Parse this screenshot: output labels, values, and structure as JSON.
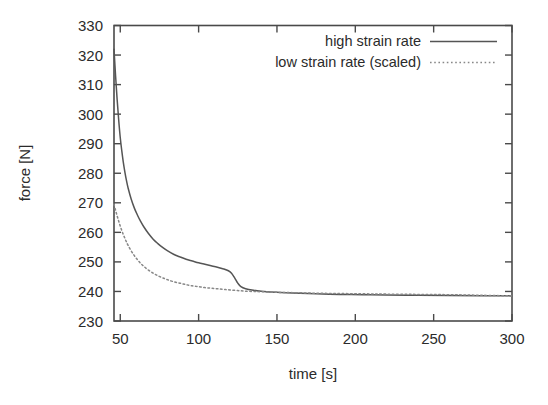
{
  "chart_data": {
    "type": "line",
    "title": "",
    "xlabel": "time [s]",
    "ylabel": "force [N]",
    "xlim": [
      46,
      300
    ],
    "ylim": [
      230,
      330
    ],
    "xticks": [
      50,
      100,
      150,
      200,
      250,
      300
    ],
    "yticks": [
      230,
      240,
      250,
      260,
      270,
      280,
      290,
      300,
      310,
      320,
      330
    ],
    "grid": false,
    "legend_position": "top-right",
    "series": [
      {
        "name": "high strain rate",
        "style": "solid",
        "color": "#555555",
        "x": [
          46,
          47,
          48,
          49,
          50,
          51,
          52,
          53,
          54,
          55,
          57,
          59,
          61,
          63,
          65,
          68,
          71,
          74,
          77,
          80,
          84,
          88,
          92,
          96,
          100,
          104,
          108,
          112,
          116,
          119,
          121,
          123,
          125,
          127,
          130,
          135,
          140,
          150,
          160,
          175,
          190,
          205,
          220,
          240,
          260,
          280,
          300
        ],
        "values": [
          322.0,
          313.0,
          305.0,
          298.0,
          292.0,
          287.5,
          283.5,
          280.2,
          277.4,
          275.0,
          271.2,
          268.2,
          265.8,
          263.7,
          261.9,
          259.6,
          257.7,
          256.2,
          254.9,
          253.8,
          252.6,
          251.7,
          250.9,
          250.3,
          249.7,
          249.2,
          248.7,
          248.2,
          247.6,
          247.0,
          246.2,
          244.6,
          242.8,
          241.6,
          240.9,
          240.4,
          240.1,
          239.7,
          239.5,
          239.2,
          239.0,
          238.9,
          238.8,
          238.7,
          238.6,
          238.55,
          238.5
        ]
      },
      {
        "name": "low strain rate (scaled)",
        "style": "dotted",
        "color": "#888888",
        "x": [
          46,
          47,
          48,
          49,
          50,
          51,
          52,
          53,
          54,
          55,
          57,
          59,
          61,
          63,
          65,
          68,
          71,
          74,
          77,
          80,
          84,
          88,
          92,
          96,
          100,
          104,
          108,
          112,
          116,
          120,
          125,
          130,
          135,
          140,
          150,
          160,
          175,
          190,
          205,
          220,
          240,
          260,
          280,
          300
        ],
        "values": [
          269.5,
          267.5,
          265.6,
          263.8,
          262.1,
          260.6,
          259.2,
          257.9,
          256.7,
          255.6,
          253.7,
          252.1,
          250.7,
          249.5,
          248.5,
          247.2,
          246.2,
          245.3,
          244.6,
          244.0,
          243.3,
          242.8,
          242.3,
          241.9,
          241.6,
          241.3,
          241.1,
          240.9,
          240.7,
          240.5,
          240.3,
          240.1,
          240.0,
          239.9,
          239.7,
          239.6,
          239.4,
          239.3,
          239.2,
          239.1,
          239.0,
          238.9,
          238.7,
          238.5
        ]
      }
    ]
  },
  "legend": {
    "entries": [
      {
        "label": "high strain rate",
        "style": "solid"
      },
      {
        "label": "low strain rate (scaled)",
        "style": "dotted"
      }
    ]
  },
  "axes": {
    "x_label": "time [s]",
    "y_label": "force [N]",
    "x_tick_labels": [
      "50",
      "100",
      "150",
      "200",
      "250",
      "300"
    ],
    "y_tick_labels": [
      "230",
      "240",
      "250",
      "260",
      "270",
      "280",
      "290",
      "300",
      "310",
      "320",
      "330"
    ]
  },
  "colors": {
    "background": "#ffffff",
    "frame": "#4a4a4a",
    "series_solid": "#555555",
    "series_dotted": "#888888",
    "text": "#2b2b2b"
  }
}
